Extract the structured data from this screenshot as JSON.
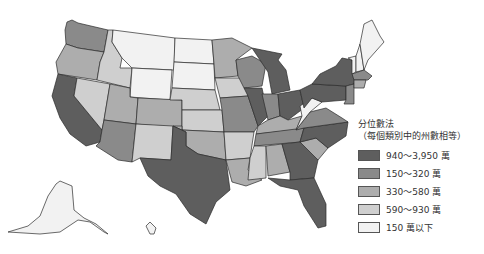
{
  "legend": {
    "title": "分位數法",
    "subtitle": "（每個類別中的州數相等）",
    "items": [
      {
        "label": "940～3,950 萬",
        "color": "#5e5e5e"
      },
      {
        "label": "150～320 萬",
        "color": "#8a8a8a"
      },
      {
        "label": "330～580 萬",
        "color": "#adadad"
      },
      {
        "label": "590～930 萬",
        "color": "#cfcfcf"
      },
      {
        "label": "150 萬以下",
        "color": "#f2f2f2"
      }
    ]
  },
  "map": {
    "title": "",
    "states": [
      {
        "name": "WA",
        "cat": 1
      },
      {
        "name": "OR",
        "cat": 2
      },
      {
        "name": "CA",
        "cat": 0
      },
      {
        "name": "ID",
        "cat": 3
      },
      {
        "name": "NV",
        "cat": 3
      },
      {
        "name": "MT",
        "cat": 4
      },
      {
        "name": "WY",
        "cat": 4
      },
      {
        "name": "UT",
        "cat": 2
      },
      {
        "name": "AZ",
        "cat": 1
      },
      {
        "name": "CO",
        "cat": 2
      },
      {
        "name": "NM",
        "cat": 3
      },
      {
        "name": "ND",
        "cat": 4
      },
      {
        "name": "SD",
        "cat": 4
      },
      {
        "name": "NE",
        "cat": 3
      },
      {
        "name": "KS",
        "cat": 3
      },
      {
        "name": "OK",
        "cat": 2
      },
      {
        "name": "TX",
        "cat": 0
      },
      {
        "name": "MN",
        "cat": 2
      },
      {
        "name": "IA",
        "cat": 3
      },
      {
        "name": "MO",
        "cat": 1
      },
      {
        "name": "AR",
        "cat": 3
      },
      {
        "name": "LA",
        "cat": 2
      },
      {
        "name": "WI",
        "cat": 1
      },
      {
        "name": "IL",
        "cat": 0
      },
      {
        "name": "MI",
        "cat": 0
      },
      {
        "name": "IN",
        "cat": 1
      },
      {
        "name": "OH",
        "cat": 0
      },
      {
        "name": "KY",
        "cat": 2
      },
      {
        "name": "TN",
        "cat": 1
      },
      {
        "name": "MS",
        "cat": 3
      },
      {
        "name": "AL",
        "cat": 2
      },
      {
        "name": "GA",
        "cat": 0
      },
      {
        "name": "FL",
        "cat": 0
      },
      {
        "name": "SC",
        "cat": 2
      },
      {
        "name": "NC",
        "cat": 0
      },
      {
        "name": "VA",
        "cat": 1
      },
      {
        "name": "WV",
        "cat": 4
      },
      {
        "name": "PA",
        "cat": 0
      },
      {
        "name": "NY",
        "cat": 0
      },
      {
        "name": "NJ",
        "cat": 1
      },
      {
        "name": "ME",
        "cat": 4
      },
      {
        "name": "NH",
        "cat": 4
      },
      {
        "name": "VT",
        "cat": 4
      },
      {
        "name": "MA",
        "cat": 1
      },
      {
        "name": "CT",
        "cat": 2
      },
      {
        "name": "AK",
        "cat": 4
      },
      {
        "name": "HI",
        "cat": 4
      }
    ]
  }
}
